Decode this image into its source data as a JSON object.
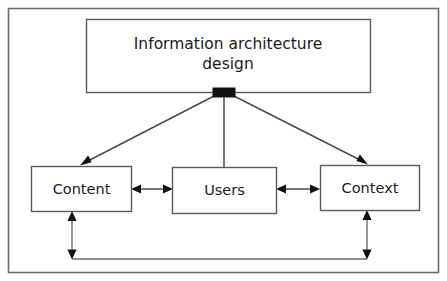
{
  "figure": {
    "background_color": "#ffffff",
    "frame_color": "#6b6b6b",
    "line_color": "#4a4a4a",
    "box_fill": "#ffffff",
    "box_stroke": "#5a5a5a",
    "junction_color": "#111111",
    "text_color": "#1a1a1a"
  },
  "nodes": {
    "root": {
      "label_line1": "Information architecture",
      "label_line2": "design"
    },
    "content": {
      "label": "Content"
    },
    "users": {
      "label": "Users"
    },
    "context": {
      "label": "Context"
    }
  },
  "connections": {
    "root_to_content": {
      "kind": "arrow-single",
      "from": "root",
      "to": "content"
    },
    "root_to_users": {
      "kind": "line-plain",
      "from": "root",
      "to": "users"
    },
    "root_to_context": {
      "kind": "arrow-single",
      "from": "root",
      "to": "context"
    },
    "content_users": {
      "kind": "arrow-double",
      "from": "content",
      "to": "users"
    },
    "users_context": {
      "kind": "arrow-double",
      "from": "users",
      "to": "context"
    },
    "content_context": {
      "kind": "arrow-double-routed",
      "from": "content",
      "to": "context"
    }
  }
}
